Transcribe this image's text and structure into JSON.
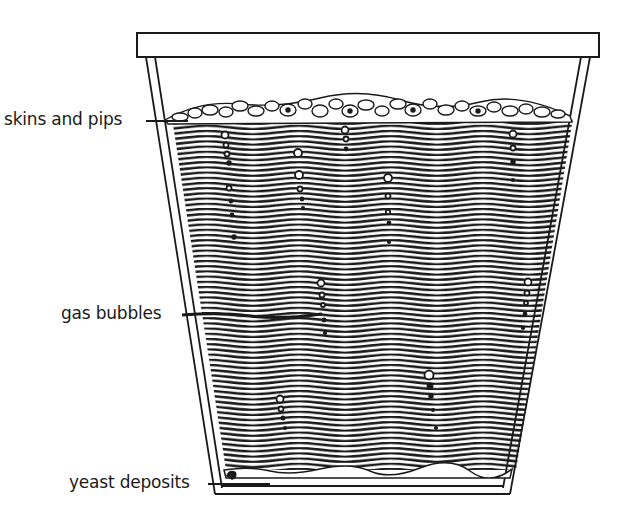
{
  "diagram": {
    "labels": {
      "skins": "skins and pips",
      "bubbles": "gas bubbles",
      "yeast": "yeast deposits"
    },
    "colors": {
      "ink": "#1a1a1a",
      "paper": "#ffffff"
    }
  }
}
